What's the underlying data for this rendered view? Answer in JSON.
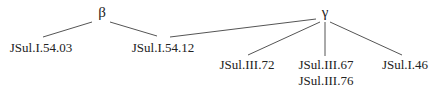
{
  "diagram": {
    "type": "stemma-tree",
    "line_color": "#555555",
    "nodes": {
      "beta": {
        "label": "β",
        "x": 102,
        "y": 5
      },
      "gamma": {
        "label": "γ",
        "x": 325,
        "y": 5
      }
    },
    "leaves": [
      {
        "id": "l1",
        "parent": "beta",
        "lines": [
          "JSul.I.54.03"
        ],
        "x": 41,
        "y": 40
      },
      {
        "id": "l2",
        "parent": "beta",
        "lines": [
          "JSul.I.54.12"
        ],
        "x": 163,
        "y": 40
      },
      {
        "id": "l3",
        "parent": "gamma",
        "lines": [
          "JSul.III.72"
        ],
        "x": 247,
        "y": 57
      },
      {
        "id": "l4",
        "parent": "gamma",
        "lines": [
          "JSul.III.67",
          "JSul.III.76"
        ],
        "x": 326,
        "y": 57
      },
      {
        "id": "l5",
        "parent": "gamma",
        "lines": [
          "JSul.I.46"
        ],
        "x": 405,
        "y": 57
      }
    ],
    "edges": [
      {
        "from": "beta",
        "to": "l1",
        "x1": 92,
        "y1": 22,
        "x2": 43,
        "y2": 37
      },
      {
        "from": "beta",
        "to": "l2",
        "x1": 110,
        "y1": 22,
        "x2": 157,
        "y2": 36
      },
      {
        "from": "gamma",
        "to": "l2",
        "x1": 316,
        "y1": 19,
        "x2": 170,
        "y2": 37
      },
      {
        "from": "gamma",
        "to": "l3",
        "x1": 320,
        "y1": 22,
        "x2": 248,
        "y2": 55
      },
      {
        "from": "gamma",
        "to": "l4",
        "x1": 325,
        "y1": 22,
        "x2": 325,
        "y2": 56
      },
      {
        "from": "gamma",
        "to": "l5",
        "x1": 330,
        "y1": 22,
        "x2": 402,
        "y2": 55
      }
    ]
  },
  "labels": {
    "beta": "β",
    "gamma": "γ",
    "leaf1": "JSul.I.54.03",
    "leaf2": "JSul.I.54.12",
    "leaf3": "JSul.III.72",
    "leaf4a": "JSul.III.67",
    "leaf4b": "JSul.III.76",
    "leaf5": "JSul.I.46"
  }
}
